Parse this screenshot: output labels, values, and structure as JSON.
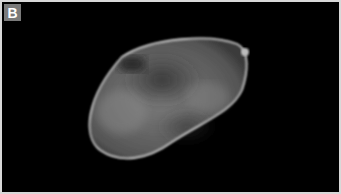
{
  "figure": {
    "panel_label": "B",
    "colors": {
      "background": "#000000",
      "frame": "#d8d8d8",
      "label_bg": "#7a7a7a",
      "label_text": "#ffffff"
    }
  }
}
